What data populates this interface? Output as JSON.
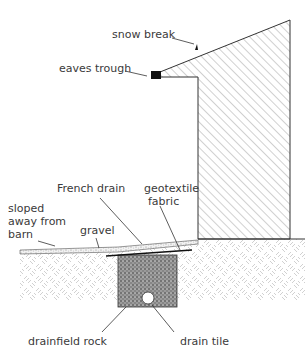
{
  "diagram": {
    "labels": {
      "snow_break": "snow break",
      "eaves_trough": "eaves trough",
      "french_drain": "French drain",
      "geotextile_line1": "geotextile",
      "geotextile_line2": "fabric",
      "sloped_line1": "sloped",
      "sloped_line2": "away from",
      "sloped_line3": "barn",
      "gravel": "gravel",
      "drainfield_rock": "drainfield rock",
      "drain_tile": "drain tile"
    },
    "colors": {
      "line": "#333333",
      "hatch": "#8a8a8a",
      "soil": "#bdbdbd",
      "rock": "#555555",
      "fill_dark": "#111111"
    }
  }
}
